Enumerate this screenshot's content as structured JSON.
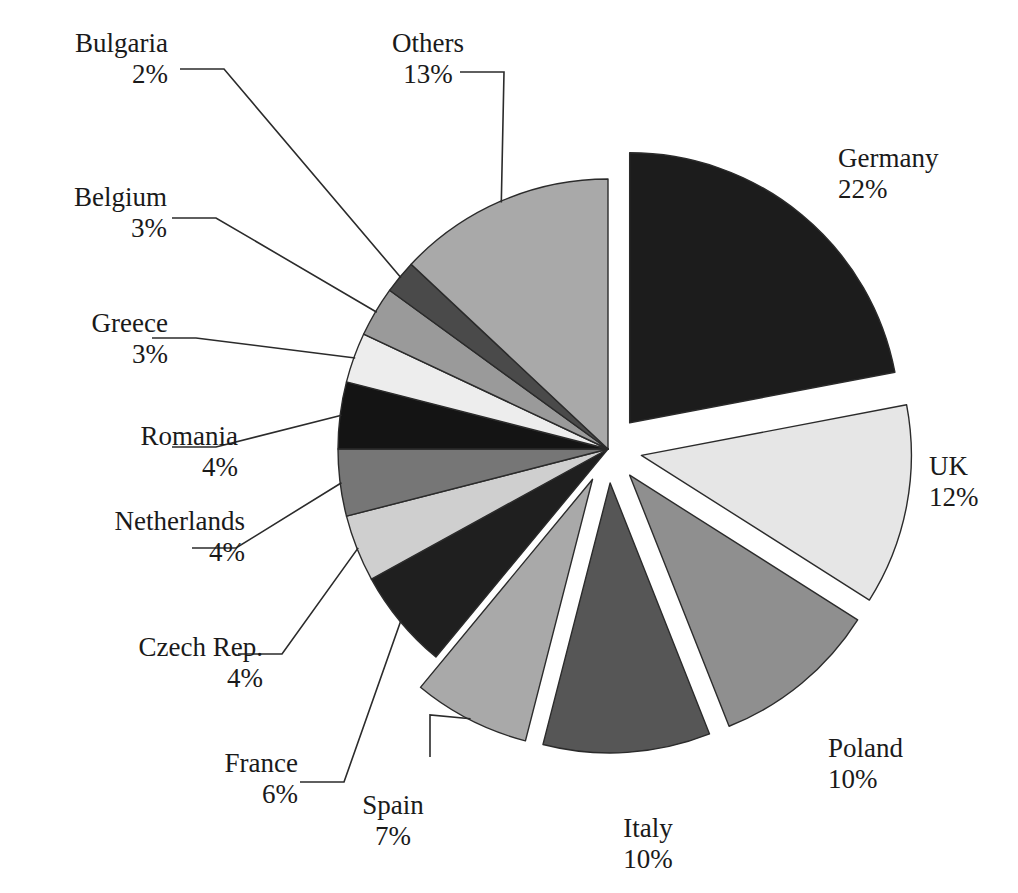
{
  "chart_data": {
    "type": "pie",
    "title": "",
    "subtitle": "",
    "unit": "%",
    "legend_position": "none",
    "grid": false,
    "exploded": true,
    "total": 100,
    "categories": [
      "Germany",
      "UK",
      "Poland",
      "Italy",
      "Spain",
      "France",
      "Czech Rep.",
      "Netherlands",
      "Romania",
      "Greece",
      "Belgium",
      "Bulgaria",
      "Others"
    ],
    "values": [
      22,
      12,
      10,
      10,
      7,
      6,
      4,
      4,
      4,
      3,
      3,
      2,
      13
    ],
    "labels": [
      "22%",
      "12%",
      "10%",
      "10%",
      "7%",
      "6%",
      "4%",
      "4%",
      "4%",
      "3%",
      "3%",
      "2%",
      "13%"
    ],
    "colors": [
      "#1c1c1c",
      "#e6e6e6",
      "#8f8f8f",
      "#565656",
      "#a9a9a9",
      "#1f1f1f",
      "#cfcfcf",
      "#767676",
      "#141414",
      "#ededed",
      "#9a9a9a",
      "#4a4a4a",
      "#a9a9a9"
    ],
    "slices": [
      {
        "name": "Germany",
        "label": "Germany",
        "pct_text": "22%",
        "value": 22,
        "color": "#1c1c1c",
        "exploded": true
      },
      {
        "name": "UK",
        "label": "UK",
        "pct_text": "12%",
        "value": 12,
        "color": "#e6e6e6",
        "exploded": true
      },
      {
        "name": "Poland",
        "label": "Poland",
        "pct_text": "10%",
        "value": 10,
        "color": "#8f8f8f",
        "exploded": true
      },
      {
        "name": "Italy",
        "label": "Italy",
        "pct_text": "10%",
        "value": 10,
        "color": "#565656",
        "exploded": true
      },
      {
        "name": "Spain",
        "label": "Spain",
        "pct_text": "7%",
        "value": 7,
        "color": "#a9a9a9",
        "exploded": true
      },
      {
        "name": "France",
        "label": "France",
        "pct_text": "6%",
        "value": 6,
        "color": "#1f1f1f",
        "exploded": false
      },
      {
        "name": "Czech Rep.",
        "label": "Czech Rep.",
        "pct_text": "4%",
        "value": 4,
        "color": "#cfcfcf",
        "exploded": false
      },
      {
        "name": "Netherlands",
        "label": "Netherlands",
        "pct_text": "4%",
        "value": 4,
        "color": "#767676",
        "exploded": false
      },
      {
        "name": "Romania",
        "label": "Romania",
        "pct_text": "4%",
        "value": 4,
        "color": "#141414",
        "exploded": false
      },
      {
        "name": "Greece",
        "label": "Greece",
        "pct_text": "3%",
        "value": 3,
        "color": "#ededed",
        "exploded": false
      },
      {
        "name": "Belgium",
        "label": "Belgium",
        "pct_text": "3%",
        "value": 3,
        "color": "#9a9a9a",
        "exploded": false
      },
      {
        "name": "Bulgaria",
        "label": "Bulgaria",
        "pct_text": "2%",
        "value": 2,
        "color": "#4a4a4a",
        "exploded": false
      },
      {
        "name": "Others",
        "label": "Others",
        "pct_text": "13%",
        "value": 13,
        "color": "#a9a9a9",
        "exploded": false
      }
    ],
    "xlabel": "",
    "ylabel": ""
  },
  "labels": {
    "germany": {
      "name": "Germany",
      "pct": "22%"
    },
    "uk": {
      "name": "UK",
      "pct": "12%"
    },
    "poland": {
      "name": "Poland",
      "pct": "10%"
    },
    "italy": {
      "name": "Italy",
      "pct": "10%"
    },
    "spain": {
      "name": "Spain",
      "pct": "7%"
    },
    "france": {
      "name": "France",
      "pct": "6%"
    },
    "czech": {
      "name": "Czech Rep.",
      "pct": "4%"
    },
    "netherlands": {
      "name": "Netherlands",
      "pct": "4%"
    },
    "romania": {
      "name": "Romania",
      "pct": "4%"
    },
    "greece": {
      "name": "Greece",
      "pct": "3%"
    },
    "belgium": {
      "name": "Belgium",
      "pct": "3%"
    },
    "bulgaria": {
      "name": "Bulgaria",
      "pct": "2%"
    },
    "others": {
      "name": "Others",
      "pct": "13%"
    }
  },
  "style": {
    "background": "#ffffff",
    "stroke": "#2b2b2b",
    "text": "#1a1a1a"
  }
}
